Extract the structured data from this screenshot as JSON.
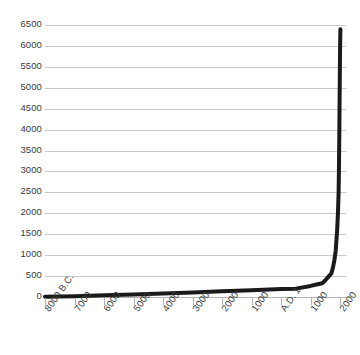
{
  "chart_data": {
    "type": "line",
    "title": "",
    "subtitle": "",
    "xlabel": "",
    "ylabel": "",
    "grid": true,
    "legend": false,
    "legend_position": "none",
    "line_color": "#1a1a1a",
    "grid_color": "#c9c9c9",
    "background_color": "#ffffff",
    "text_color": "#3a3a3a",
    "xlim": [
      -8000,
      2200
    ],
    "ylim": [
      0,
      6500
    ],
    "ytick_labels": [
      "6500",
      "6000",
      "5500",
      "5000",
      "4500",
      "4000",
      "3500",
      "3000",
      "2500",
      "2000",
      "1500",
      "1000",
      "500",
      "0"
    ],
    "ytick_values": [
      6500,
      6000,
      5500,
      5000,
      4500,
      4000,
      3500,
      3000,
      2500,
      2000,
      1500,
      1000,
      500,
      0
    ],
    "xtick_labels": [
      "8000 B.C.",
      "7000",
      "6000",
      "5000",
      "4000",
      "3000",
      "2000",
      "1000",
      "A.D. 1",
      "1000",
      "2000"
    ],
    "xtick_values": [
      -8000,
      -7000,
      -6000,
      -5000,
      -4000,
      -3000,
      -2000,
      -1000,
      1,
      1000,
      2000
    ],
    "series": [
      {
        "name": "",
        "x": [
          -8000,
          -7000,
          -6000,
          -5000,
          -4000,
          -3000,
          -2000,
          -1000,
          1,
          500,
          1000,
          1200,
          1400,
          1500,
          1600,
          1700,
          1750,
          1800,
          1850,
          1900,
          1927,
          1950,
          1960,
          1975,
          1987,
          2000,
          2010
        ],
        "values": [
          5,
          20,
          40,
          60,
          85,
          110,
          140,
          160,
          190,
          200,
          265,
          300,
          330,
          400,
          480,
          560,
          680,
          850,
          1100,
          1600,
          2000,
          2500,
          3000,
          4000,
          5000,
          6000,
          6400
        ]
      }
    ]
  }
}
